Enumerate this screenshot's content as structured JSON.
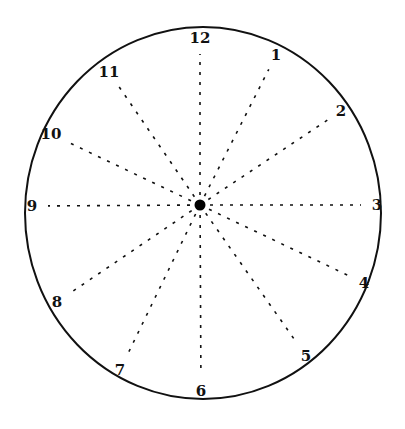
{
  "diagram": {
    "type": "clock-face",
    "face": {
      "cx": 203,
      "cy": 213,
      "rx": 178,
      "ry": 186,
      "stroke": "#111111",
      "stroke_width": 2
    },
    "center_dot": {
      "cx": 200,
      "cy": 205,
      "r": 5.5,
      "color": "#000000"
    },
    "spokes": {
      "style": "dashed",
      "color": "#111111",
      "dash": "3,7",
      "stroke_width": 1.6
    },
    "hours": [
      {
        "label": "12",
        "x": 200,
        "y": 38
      },
      {
        "label": "1",
        "x": 276,
        "y": 55
      },
      {
        "label": "2",
        "x": 341,
        "y": 111
      },
      {
        "label": "3",
        "x": 377,
        "y": 205
      },
      {
        "label": "4",
        "x": 364,
        "y": 283
      },
      {
        "label": "5",
        "x": 306,
        "y": 356
      },
      {
        "label": "6",
        "x": 201,
        "y": 391
      },
      {
        "label": "7",
        "x": 120,
        "y": 370
      },
      {
        "label": "8",
        "x": 57,
        "y": 302
      },
      {
        "label": "9",
        "x": 32,
        "y": 206
      },
      {
        "label": "10",
        "x": 51,
        "y": 134
      },
      {
        "label": "11",
        "x": 109,
        "y": 72
      }
    ]
  }
}
